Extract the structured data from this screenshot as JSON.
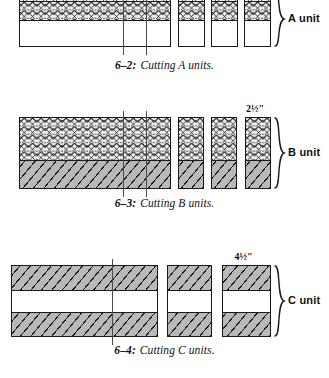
{
  "page": {
    "background": "#ffffff",
    "ink": "#111111"
  },
  "figures": [
    {
      "id": "fig-6-2",
      "caption_number": "6–2:",
      "caption_text": "Cutting A units.",
      "unit_label": "A unit",
      "dimension_label": "",
      "strip": {
        "bands": [
          {
            "name": "dot-print-band",
            "fill": "dotprint",
            "height_px": 9
          },
          {
            "name": "x-print-band",
            "fill": "xprint",
            "height_px": 19
          },
          {
            "name": "plain-band",
            "fill": "plain",
            "height_px": 26
          }
        ]
      },
      "pieces": [
        {
          "name": "uncut-strip",
          "x": 19,
          "width": 152
        },
        {
          "name": "cut-piece-1",
          "x": 178,
          "width": 27
        },
        {
          "name": "cut-piece-2",
          "x": 211,
          "width": 27
        },
        {
          "name": "cut-piece-3",
          "x": 244,
          "width": 27
        }
      ],
      "cut_lines": [
        123,
        146
      ]
    },
    {
      "id": "fig-6-3",
      "caption_number": "6–3:",
      "caption_text": "Cutting B units.",
      "unit_label": "B unit",
      "dimension_label": "2½\"",
      "strip": {
        "bands": [
          {
            "name": "x-print-band",
            "fill": "xprint",
            "height_px": 42
          },
          {
            "name": "hatch-band",
            "fill": "hatch",
            "height_px": 28
          }
        ]
      },
      "pieces": [
        {
          "name": "uncut-strip",
          "x": 19,
          "width": 152
        },
        {
          "name": "cut-piece-1",
          "x": 178,
          "width": 26
        },
        {
          "name": "cut-piece-2",
          "x": 211,
          "width": 26
        },
        {
          "name": "cut-piece-3",
          "x": 245,
          "width": 26
        }
      ],
      "cut_lines": [
        123,
        146
      ]
    },
    {
      "id": "fig-6-4",
      "caption_number": "6–4:",
      "caption_text": "Cutting C units.",
      "unit_label": "C unit",
      "dimension_label": "4½\"",
      "strip": {
        "bands": [
          {
            "name": "hatch-band-top",
            "fill": "hatch",
            "height_px": 24
          },
          {
            "name": "plain-band-middle",
            "fill": "plain",
            "height_px": 22
          },
          {
            "name": "hatch-band-bottom",
            "fill": "hatch",
            "height_px": 24
          }
        ]
      },
      "pieces": [
        {
          "name": "uncut-strip",
          "x": 11,
          "width": 147
        },
        {
          "name": "cut-piece-1",
          "x": 167,
          "width": 45
        },
        {
          "name": "cut-piece-2",
          "x": 222,
          "width": 49
        }
      ],
      "cut_lines": [
        112
      ]
    }
  ]
}
